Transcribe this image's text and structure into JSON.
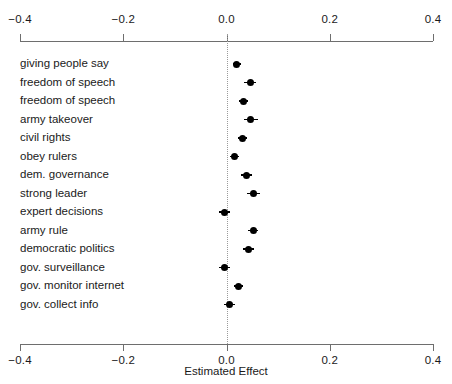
{
  "chart_data": {
    "type": "scatter",
    "title": "",
    "xlabel": "Estimated Effect",
    "ylabel": "",
    "xlim": [
      -0.4,
      0.4
    ],
    "xticks": [
      -0.4,
      -0.2,
      0.0,
      0.2,
      0.4
    ],
    "xticklabels": [
      "−0.4",
      "−0.2",
      "0.0",
      "0.2",
      "0.4"
    ],
    "grid": false,
    "legend": null,
    "reference_line": 0.0,
    "axis_top": true,
    "axis_bottom": true,
    "categories": [
      "giving people say",
      "freedom of speech",
      "freedom of speech",
      "army takeover",
      "civil rights",
      "obey rulers",
      "dem. governance",
      "strong leader",
      "expert decisions",
      "army rule",
      "democratic politics",
      "gov. surveillance",
      "gov. monitor internet",
      "gov. collect info"
    ],
    "points": [
      {
        "label": "giving people say",
        "estimate": 0.02,
        "ci_low": 0.012,
        "ci_high": 0.028
      },
      {
        "label": "freedom of speech",
        "estimate": 0.046,
        "ci_low": 0.034,
        "ci_high": 0.058
      },
      {
        "label": "freedom of speech",
        "estimate": 0.033,
        "ci_low": 0.025,
        "ci_high": 0.041
      },
      {
        "label": "army takeover",
        "estimate": 0.047,
        "ci_low": 0.033,
        "ci_high": 0.061
      },
      {
        "label": "civil rights",
        "estimate": 0.031,
        "ci_low": 0.022,
        "ci_high": 0.04
      },
      {
        "label": "obey rulers",
        "estimate": 0.016,
        "ci_low": 0.007,
        "ci_high": 0.025
      },
      {
        "label": "dem. governance",
        "estimate": 0.039,
        "ci_low": 0.029,
        "ci_high": 0.049
      },
      {
        "label": "strong leader",
        "estimate": 0.052,
        "ci_low": 0.04,
        "ci_high": 0.064
      },
      {
        "label": "expert decisions",
        "estimate": -0.004,
        "ci_low": -0.015,
        "ci_high": 0.007
      },
      {
        "label": "army rule",
        "estimate": 0.052,
        "ci_low": 0.042,
        "ci_high": 0.062
      },
      {
        "label": "democratic politics",
        "estimate": 0.042,
        "ci_low": 0.031,
        "ci_high": 0.053
      },
      {
        "label": "gov. surveillance",
        "estimate": -0.004,
        "ci_low": -0.015,
        "ci_high": 0.007
      },
      {
        "label": "gov. monitor internet",
        "estimate": 0.023,
        "ci_low": 0.014,
        "ci_high": 0.032
      },
      {
        "label": "gov. collect info",
        "estimate": 0.006,
        "ci_low": -0.004,
        "ci_high": 0.016
      }
    ]
  },
  "colors": {
    "point": "#000000",
    "axis": "#6e6e6e",
    "zero_line": "#9a9a9a",
    "background": "#ffffff"
  }
}
